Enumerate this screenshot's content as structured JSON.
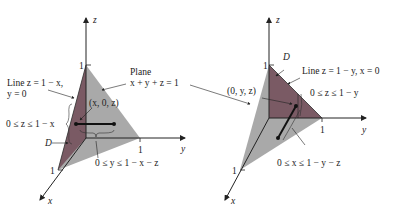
{
  "left_figure": {
    "axis_labels": {
      "z": "z",
      "y": "y",
      "x": "x"
    },
    "ticks": {
      "z": "1",
      "y": "1",
      "x": "1"
    },
    "line_label_1": "Line z = 1 − x,",
    "line_label_2": "y = 0",
    "plane_label_1": "Plane",
    "plane_label_2": "x + y + z = 1",
    "point_label": "(x, 0, z)",
    "z_range": "0 ≤ z ≤ 1 − x",
    "region_label": "D",
    "y_range": "0 ≤ y ≤ 1 − x − z"
  },
  "right_figure": {
    "axis_labels": {
      "z": "z",
      "y": "y",
      "x": "x"
    },
    "ticks": {
      "z": "1",
      "y": "1",
      "x": "1"
    },
    "region_label": "D",
    "line_label": "Line z = 1 − y, x = 0",
    "point_label": "(0, y, z)",
    "z_range": "0 ≤ z ≤ 1 − y",
    "x_range": "0 ≤ x ≤ 1 − y − z"
  },
  "colors": {
    "face_light": "#a9a9a9",
    "face_dark": "#7a5a64",
    "axis": "#222222"
  }
}
